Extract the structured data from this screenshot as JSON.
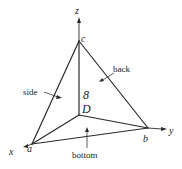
{
  "diagram": {
    "type": "tetrahedron-free-body",
    "axes": {
      "x": {
        "label": "x"
      },
      "y": {
        "label": "y"
      },
      "z": {
        "label": "z"
      }
    },
    "vertices": {
      "a": {
        "label": "a"
      },
      "b": {
        "label": "b"
      },
      "c": {
        "label": "c"
      },
      "origin": {
        "label": "D"
      }
    },
    "center_label": "8",
    "faces": {
      "side": {
        "label": "side"
      },
      "back": {
        "label": "back"
      },
      "bottom": {
        "label": "bottom"
      }
    },
    "colors": {
      "line": "#2a2a2a",
      "text": "#222222",
      "background": "#ffffff"
    }
  }
}
